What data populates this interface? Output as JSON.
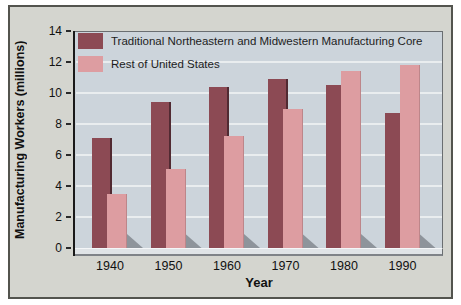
{
  "figure": {
    "y_axis_title": "Manufacturing Workers (millions)",
    "x_axis_title": "Year"
  },
  "chart_data": {
    "type": "bar",
    "title": "",
    "xlabel": "Year",
    "ylabel": "Manufacturing Workers (millions)",
    "categories": [
      "1940",
      "1950",
      "1960",
      "1970",
      "1980",
      "1990"
    ],
    "series": [
      {
        "name": "Traditional Northeastern and Midwestern Manufacturing Core",
        "color": "#8c4a54",
        "values": [
          7.1,
          9.4,
          10.4,
          10.9,
          10.5,
          8.7
        ]
      },
      {
        "name": "Rest of United States",
        "color": "#dd9da1",
        "values": [
          3.5,
          5.1,
          7.2,
          9.0,
          11.4,
          11.8
        ]
      }
    ],
    "ylim": [
      0,
      14
    ],
    "ytick_step": 2,
    "yticks": [
      0,
      2,
      4,
      6,
      8,
      10,
      12,
      14
    ],
    "grid": true,
    "legend_position": "top-left",
    "style_3d_shadow": true
  },
  "colors": {
    "core_bar": "#8c4a54",
    "rest_bar": "#dd9da1",
    "figure_bg": "#d4d5cf",
    "plot_bg": "#ccd4db",
    "gridline": "#e9edef",
    "bar_shadow": "#8e949b",
    "text": "#111111"
  }
}
